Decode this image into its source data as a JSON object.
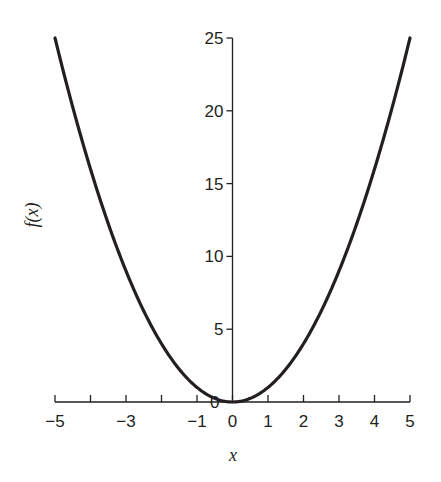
{
  "chart_data": {
    "type": "line",
    "title": "",
    "xlabel": "x",
    "ylabel": "f(x)",
    "xlim": [
      -5,
      5
    ],
    "ylim": [
      0,
      25
    ],
    "grid": false,
    "legend": null,
    "x_ticks": [
      -5,
      -4,
      -3,
      -2,
      -1,
      0,
      1,
      2,
      3,
      4,
      5
    ],
    "x_tick_labels": [
      "−5",
      "",
      "−3",
      "",
      "−1",
      "0",
      "1",
      "2",
      "3",
      "4",
      "5"
    ],
    "y_ticks": [
      0,
      5,
      10,
      15,
      20,
      25
    ],
    "y_tick_labels": [
      "0",
      "5",
      "10",
      "15",
      "20",
      "25"
    ],
    "series": [
      {
        "name": "f(x) = x^2",
        "color": "#231f20",
        "x": [
          -5,
          -4.5,
          -4,
          -3.5,
          -3,
          -2.5,
          -2,
          -1.5,
          -1,
          -0.5,
          0,
          0.5,
          1,
          1.5,
          2,
          2.5,
          3,
          3.5,
          4,
          4.5,
          5
        ],
        "y": [
          25,
          20.25,
          16,
          12.25,
          9,
          6.25,
          4,
          2.25,
          1,
          0.25,
          0,
          0.25,
          1,
          2.25,
          4,
          6.25,
          9,
          12.25,
          16,
          20.25,
          25
        ]
      }
    ]
  },
  "labels": {
    "xlabel": "x",
    "ylabel": "f(x)"
  }
}
